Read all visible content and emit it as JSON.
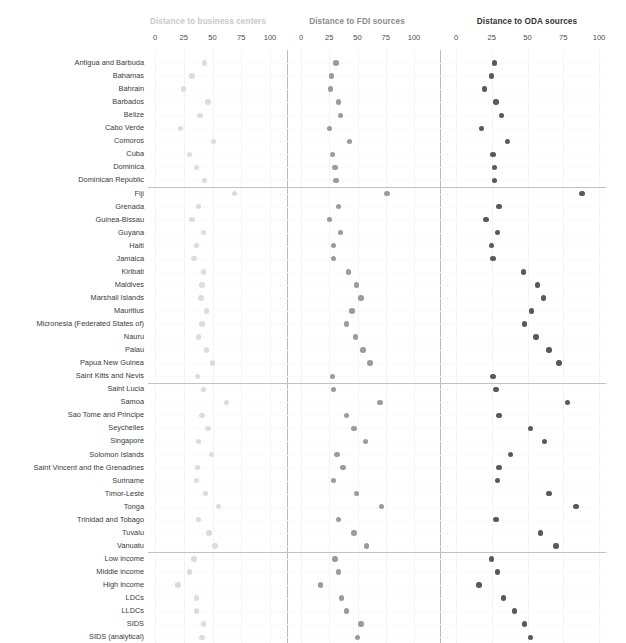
{
  "chart_data": {
    "type": "scatter",
    "title": "",
    "xlabel": "",
    "ylabel": "",
    "xlim": [
      0,
      110
    ],
    "xticks": [
      0,
      25,
      50,
      75,
      100
    ],
    "grid": true,
    "legend_position": "none",
    "panels": [
      {
        "id": "business",
        "title": "Distance to business centers",
        "color": "#dcdcdc"
      },
      {
        "id": "fdi",
        "title": "Distance to FDI sources",
        "color": "#9b9b9b"
      },
      {
        "id": "oda",
        "title": "Distance to ODA sources",
        "color": "#595959"
      }
    ],
    "categories": [
      "Antigua and Barbuda",
      "Bahamas",
      "Bahrain",
      "Barbados",
      "Belize",
      "Cabo Verde",
      "Comoros",
      "Cuba",
      "Dominica",
      "Dominican Republic",
      "Fiji",
      "Grenada",
      "Guinea-Bissau",
      "Guyana",
      "Haiti",
      "Jamaica",
      "Kiribati",
      "Maldives",
      "Marshall Islands",
      "Mauritius",
      "Micronesia (Federated States of)",
      "Nauru",
      "Palau",
      "Papua New Guinea",
      "Saint Kitts and Nevis",
      "Saint Lucia",
      "Samoa",
      "Sao Tome and Principe",
      "Seychelles",
      "Singapore",
      "Solomon Islands",
      "Saint Vincent and the Grenadines",
      "Suriname",
      "Timor-Leste",
      "Tonga",
      "Trinidad and Tobago",
      "Tuvalu",
      "Vanuatu",
      "Low income",
      "Middle income",
      "High income",
      "LDCs",
      "LLDCs",
      "SIDS",
      "SIDS (analytical)"
    ],
    "series": [
      {
        "name": "Distance to business centers",
        "panel": "business",
        "values": [
          43,
          32,
          25,
          46,
          39,
          22,
          51,
          30,
          36,
          43,
          69,
          38,
          32,
          42,
          36,
          34,
          42,
          41,
          40,
          45,
          41,
          38,
          45,
          50,
          37,
          42,
          62,
          41,
          46,
          38,
          49,
          37,
          36,
          44,
          55,
          38,
          47,
          52,
          34,
          30,
          20,
          36,
          36,
          42,
          41
        ]
      },
      {
        "name": "Distance to FDI sources",
        "panel": "fdi",
        "values": [
          31,
          27,
          26,
          33,
          35,
          25,
          43,
          28,
          30,
          31,
          76,
          33,
          25,
          35,
          29,
          29,
          42,
          49,
          53,
          45,
          40,
          48,
          55,
          61,
          28,
          29,
          70,
          40,
          47,
          57,
          32,
          37,
          29,
          49,
          71,
          33,
          47,
          58,
          30,
          33,
          17,
          36,
          40,
          53,
          50
        ]
      },
      {
        "name": "Distance to ODA sources",
        "panel": "oda",
        "values": [
          27,
          25,
          20,
          28,
          32,
          18,
          36,
          26,
          27,
          27,
          88,
          30,
          21,
          29,
          25,
          26,
          47,
          57,
          61,
          53,
          48,
          56,
          65,
          72,
          26,
          28,
          78,
          30,
          52,
          62,
          38,
          30,
          29,
          65,
          84,
          28,
          59,
          70,
          25,
          29,
          16,
          33,
          41,
          48,
          52
        ]
      }
    ],
    "group_separators_after": [
      9,
      24,
      37
    ]
  }
}
